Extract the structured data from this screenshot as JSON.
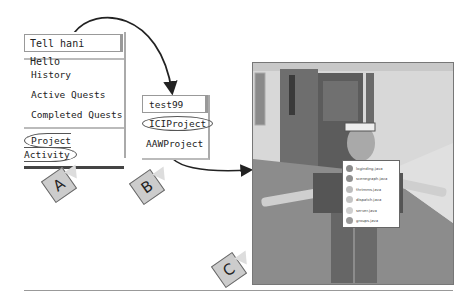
{
  "menu_a": {
    "title": "Tell hani Hello",
    "items": [
      "History",
      "Active Quests",
      "Completed Quests"
    ],
    "selected": "Project Activity",
    "tag": "A"
  },
  "menu_b": {
    "title": "test99",
    "selected": "ICIProject",
    "items": [
      "AAWProject"
    ],
    "tag": "B"
  },
  "scene": {
    "tag": "C",
    "popup_items": [
      {
        "label": "loginding.java",
        "color": "#8a8a8a"
      },
      {
        "label": "scenegraph.java",
        "color": "#8f8f8f"
      },
      {
        "label": "thrimms.java",
        "color": "#bdbdbd"
      },
      {
        "label": "dispatch.java",
        "color": "#c4c4c4"
      },
      {
        "label": "server.java",
        "color": "#cfcfcf"
      },
      {
        "label": "groups.java",
        "color": "#9a9a9a"
      }
    ]
  }
}
